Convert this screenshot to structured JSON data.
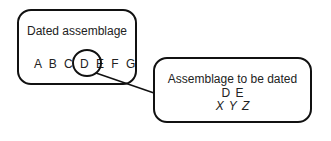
{
  "diagram": {
    "dated_box": {
      "title": "Dated assemblage",
      "letters": "A B C D E F G",
      "highlighted": "D E"
    },
    "undated_box": {
      "title": "Assemblage to be dated",
      "shared_letters": "D E",
      "new_letters": "X Y Z"
    }
  }
}
